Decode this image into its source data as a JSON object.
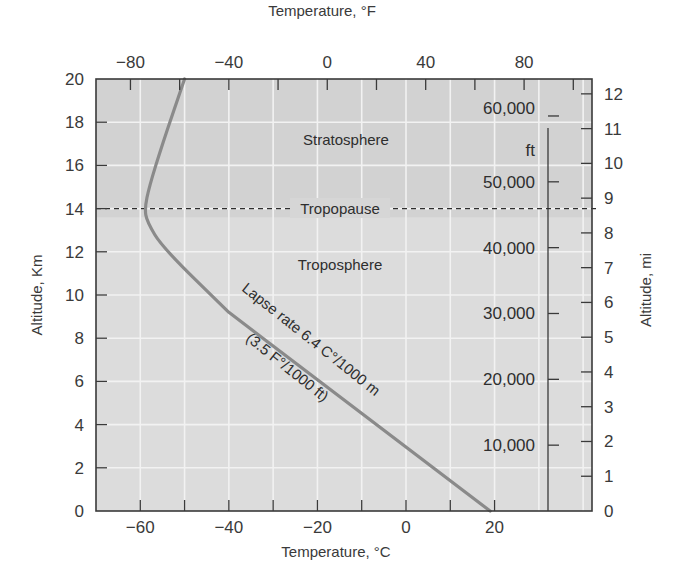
{
  "chart_data": {
    "type": "line",
    "title": "",
    "xlabel_bottom": "Temperature, °C",
    "xlabel_top": "Temperature, °F",
    "ylabel_left": "Altitude, Km",
    "ylabel_right": "Altitude, mi",
    "xlim_c": [
      -70,
      42
    ],
    "ylim_km": [
      0,
      20
    ],
    "grid": true,
    "bottom_ticks": [
      "-60",
      "-40",
      "-20",
      "0",
      "20"
    ],
    "bottom_tick_values": [
      -60,
      -40,
      -20,
      0,
      20
    ],
    "top_ticks": [
      "-80",
      "-40",
      "0",
      "40",
      "80"
    ],
    "top_tick_values_f": [
      -80,
      -40,
      0,
      40,
      80
    ],
    "left_ticks": [
      "0",
      "2",
      "4",
      "6",
      "8",
      "10",
      "12",
      "14",
      "16",
      "18",
      "20"
    ],
    "left_tick_values": [
      0,
      2,
      4,
      6,
      8,
      10,
      12,
      14,
      16,
      18,
      20
    ],
    "right_ticks": [
      "0",
      "1",
      "2",
      "3",
      "4",
      "5",
      "6",
      "7",
      "8",
      "9",
      "10",
      "11",
      "12"
    ],
    "right_tick_values_mi": [
      0,
      1,
      2,
      3,
      4,
      5,
      6,
      7,
      8,
      9,
      10,
      11,
      12
    ],
    "feet_ticks": [
      "10,000",
      "20,000",
      "30,000",
      "40,000",
      "50,000",
      "60,000"
    ],
    "feet_tick_values": [
      10000,
      20000,
      30000,
      40000,
      50000,
      60000
    ],
    "feet_unit": "ft",
    "series": [
      {
        "name": "Temperature profile",
        "color": "#8a8a8a",
        "x_temp_c": [
          19,
          -40,
          -55,
          -58.5,
          -59,
          -58,
          -55,
          -50
        ],
        "y_alt_km": [
          0,
          9.2,
          12.2,
          13.4,
          14,
          15,
          17,
          20
        ]
      }
    ],
    "tropopause_km": 14,
    "annotations": {
      "stratosphere": "Stratosphere",
      "tropopause": "Tropopause",
      "troposphere": "Troposphere",
      "lapse_rate_line1": "Lapse rate 6.4 C°/1000 m",
      "lapse_rate_line2": "(3.5 F°/1000 ft)"
    },
    "colors": {
      "plot_bg": "#dcdcdc",
      "stratosphere_bg": "#d2d2d2",
      "grid": "#f2f2f2",
      "frame": "#3a3a3a",
      "curve": "#8a8a8a"
    }
  }
}
